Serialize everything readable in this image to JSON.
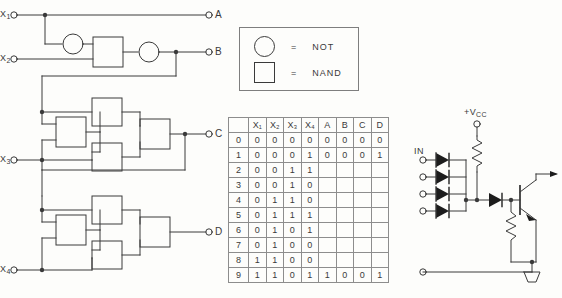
{
  "diagram": {
    "line_color": "#3a3a3a",
    "background": "#fdfdfb"
  },
  "logic_circuit": {
    "inputs": [
      {
        "name": "X1",
        "label": "X",
        "sub": "1"
      },
      {
        "name": "X2",
        "label": "X",
        "sub": "2"
      },
      {
        "name": "X3",
        "label": "X",
        "sub": "3"
      },
      {
        "name": "X4",
        "label": "X",
        "sub": "4"
      }
    ],
    "outputs": [
      {
        "name": "A",
        "label": "A"
      },
      {
        "name": "B",
        "label": "B"
      },
      {
        "name": "C",
        "label": "C"
      },
      {
        "name": "D",
        "label": "D"
      }
    ]
  },
  "legend": {
    "rows": [
      {
        "symbol": "circle",
        "equals": "=",
        "text": "NOT"
      },
      {
        "symbol": "square",
        "equals": "=",
        "text": "NAND"
      }
    ]
  },
  "truth_table": {
    "headers": [
      "",
      "X₁",
      "X₂",
      "X₃",
      "X₄",
      "A",
      "B",
      "C",
      "D"
    ],
    "rows": [
      [
        "0",
        "0",
        "0",
        "0",
        "0",
        "0",
        "0",
        "0",
        "0"
      ],
      [
        "1",
        "0",
        "0",
        "0",
        "1",
        "0",
        "0",
        "0",
        "1"
      ],
      [
        "2",
        "0",
        "0",
        "1",
        "1",
        "",
        "",
        "",
        ""
      ],
      [
        "3",
        "0",
        "0",
        "1",
        "0",
        "",
        "",
        "",
        ""
      ],
      [
        "4",
        "0",
        "1",
        "1",
        "0",
        "",
        "",
        "",
        ""
      ],
      [
        "5",
        "0",
        "1",
        "1",
        "1",
        "",
        "",
        "",
        ""
      ],
      [
        "6",
        "0",
        "1",
        "0",
        "1",
        "",
        "",
        "",
        ""
      ],
      [
        "7",
        "0",
        "1",
        "0",
        "0",
        "",
        "",
        "",
        ""
      ],
      [
        "8",
        "1",
        "1",
        "0",
        "0",
        "",
        "",
        "",
        ""
      ],
      [
        "9",
        "1",
        "1",
        "0",
        "1",
        "1",
        "0",
        "0",
        "1"
      ]
    ]
  },
  "dtl_circuit": {
    "supply_label": "+V",
    "supply_sub": "CC",
    "input_label": "IN",
    "input_terminal_count": 4,
    "diode_count": 4,
    "series_diode_count": 1,
    "resistor_count": 3,
    "transistor_type": "NPN"
  }
}
